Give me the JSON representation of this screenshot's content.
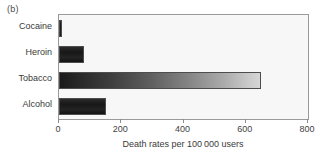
{
  "panel": {
    "label": "(b)"
  },
  "chart_data": {
    "type": "bar",
    "orientation": "horizontal",
    "title": "",
    "subtitle": "",
    "xlabel": "Death rates per 100 000 users",
    "ylabel": "",
    "categories": [
      "Cocaine",
      "Heroin",
      "Tobacco",
      "Alcohol"
    ],
    "values": [
      10,
      80,
      650,
      150
    ],
    "xlim": [
      0,
      800
    ],
    "xticks": [
      0,
      200,
      400,
      600,
      800
    ],
    "xticklabels": [
      "0",
      "200",
      "400",
      "600",
      "800"
    ],
    "grid": false,
    "legend": false,
    "bar_styles": [
      "solid-dark",
      "solid-dark",
      "gradient-dark-to-light",
      "solid-dark"
    ],
    "colors": {
      "bar_dark": "#1a1a1a",
      "bar_gradient_start": "#1a1a1a",
      "bar_gradient_end": "#d6d6d6",
      "bar_edge": "#4d4d4d",
      "plot_background": "#f7f7f7",
      "frame": "#9a9a9a",
      "text": "#3a3a3a"
    }
  }
}
